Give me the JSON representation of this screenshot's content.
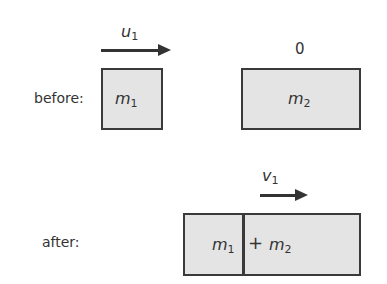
{
  "before": {
    "label": "before:",
    "velocity1": {
      "symbol": "u",
      "subscript": "1"
    },
    "velocity2": "0",
    "mass1": {
      "symbol": "m",
      "subscript": "1"
    },
    "mass2": {
      "symbol": "m",
      "subscript": "2"
    }
  },
  "after": {
    "label": "after:",
    "velocity": {
      "symbol": "v",
      "subscript": "1"
    },
    "mass1": {
      "symbol": "m",
      "subscript": "1"
    },
    "plus": "+",
    "mass2": {
      "symbol": "m",
      "subscript": "2"
    }
  },
  "colors": {
    "box_fill": "#e4e4e4",
    "border": "#3a3a3a",
    "text": "#333333"
  }
}
